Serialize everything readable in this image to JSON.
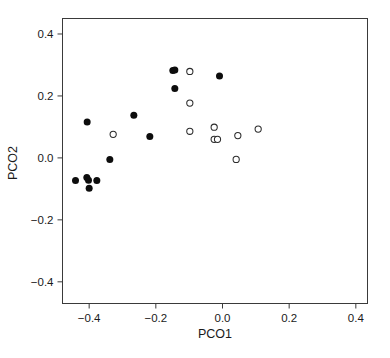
{
  "chart_data": {
    "type": "scatter",
    "title": "",
    "xlabel": "PCO1",
    "ylabel": "PCO2",
    "xlim": [
      -0.48,
      0.435
    ],
    "ylim": [
      -0.47,
      0.45
    ],
    "xticks": [
      "-0.4",
      "-0.2",
      "0.0",
      "0.2",
      "0.4"
    ],
    "xtick_values": [
      -0.4,
      -0.2,
      0.0,
      0.2,
      0.4
    ],
    "yticks": [
      "0.4",
      "0.2",
      "0.0",
      "-0.2",
      "-0.4"
    ],
    "ytick_values": [
      0.4,
      0.2,
      0.0,
      -0.2,
      -0.4
    ],
    "grid": false,
    "legend": null,
    "frame": "box",
    "series": [
      {
        "name": "filled",
        "marker": "filled-circle",
        "color": "#0d0d0d",
        "points": [
          [
            -0.149,
            0.282
          ],
          [
            -0.143,
            0.284
          ],
          [
            -0.009,
            0.264
          ],
          [
            -0.143,
            0.224
          ],
          [
            -0.266,
            0.138
          ],
          [
            -0.406,
            0.116
          ],
          [
            -0.218,
            0.069
          ],
          [
            -0.338,
            -0.005
          ],
          [
            -0.441,
            -0.073
          ],
          [
            -0.407,
            -0.063
          ],
          [
            -0.402,
            -0.072
          ],
          [
            -0.377,
            -0.073
          ],
          [
            -0.4,
            -0.098
          ]
        ]
      },
      {
        "name": "open",
        "marker": "open-circle",
        "color": "#2b2b2b",
        "points": [
          [
            -0.098,
            0.279
          ],
          [
            -0.098,
            0.177
          ],
          [
            -0.025,
            0.099
          ],
          [
            -0.328,
            0.076
          ],
          [
            0.046,
            0.072
          ],
          [
            0.107,
            0.093
          ],
          [
            -0.098,
            0.086
          ],
          [
            -0.025,
            0.06
          ],
          [
            -0.015,
            0.06
          ],
          [
            0.041,
            -0.005
          ]
        ]
      }
    ],
    "n_points": 23
  },
  "axes": {
    "x_title": "PCO1",
    "y_title": "PCO2"
  }
}
